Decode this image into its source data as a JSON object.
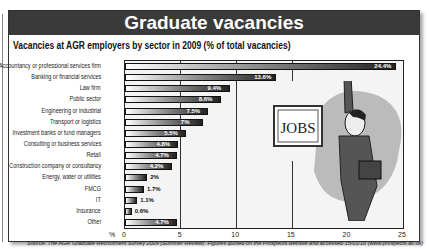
{
  "header": {
    "title": "Graduate vacancies"
  },
  "subtitle": "Vacancies at AGR employers by sector in 2009 (% of total vacancies)",
  "illustration": {
    "sign_text": "JOBS"
  },
  "axis": {
    "unit_label": "%",
    "ticks": [
      "0",
      "5",
      "10",
      "15",
      "20",
      "25"
    ]
  },
  "source": "Source: The AGR Graduate Recruitment Survey 2009 (Summer Review). Figures quoted on the Prospects website and accessed 15/01/10 (www.prospects.ac.uk)",
  "labels": {
    "c0": "Accountancy or professional services firm",
    "c1": "Banking or financial services",
    "c2": "Law firm",
    "c3": "Public sector",
    "c4": "Engineering or industrial",
    "c5": "Transport or logistics",
    "c6": "Investment banks or fund managers",
    "c7": "Consulting or business services",
    "c8": "Retail",
    "c9": "Construction company or consultancy",
    "c10": "Energy, water or utilities",
    "c11": "FMCG",
    "c12": "IT",
    "c13": "Insurance",
    "c14": "Other",
    "v0": "24.4%",
    "v1": "13.6%",
    "v2": "9.4%",
    "v3": "8.6%",
    "v4": "7.5%",
    "v5": "7%",
    "v6": "5.5%",
    "v7": "4.8%",
    "v8": "4.7%",
    "v9": "4.2%",
    "v10": "2%",
    "v11": "1.7%",
    "v12": "1.1%",
    "v13": "0.6%",
    "v14": "4.7%"
  },
  "chart_data": {
    "type": "bar",
    "orientation": "horizontal",
    "title": "Vacancies at AGR employers by sector in 2009 (% of total vacancies)",
    "xlabel": "%",
    "ylabel": "",
    "xlim": [
      0,
      25
    ],
    "xticks": [
      0,
      5,
      10,
      15,
      20,
      25
    ],
    "grid": true,
    "categories": [
      "Accountancy or professional services firm",
      "Banking or financial services",
      "Law firm",
      "Public sector",
      "Engineering or industrial",
      "Transport or logistics",
      "Investment banks or fund managers",
      "Consulting or business services",
      "Retail",
      "Construction company or consultancy",
      "Energy, water or utilities",
      "FMCG",
      "IT",
      "Insurance",
      "Other"
    ],
    "values": [
      24.4,
      13.6,
      9.4,
      8.6,
      7.5,
      7,
      5.5,
      4.8,
      4.7,
      4.2,
      2,
      1.7,
      1.1,
      0.6,
      4.7
    ],
    "data_labels": [
      "24.4%",
      "13.6%",
      "9.4%",
      "8.6%",
      "7.5%",
      "7%",
      "5.5%",
      "4.8%",
      "4.7%",
      "4.2%",
      "2%",
      "1.7%",
      "1.1%",
      "0.6%",
      "4.7%"
    ]
  }
}
